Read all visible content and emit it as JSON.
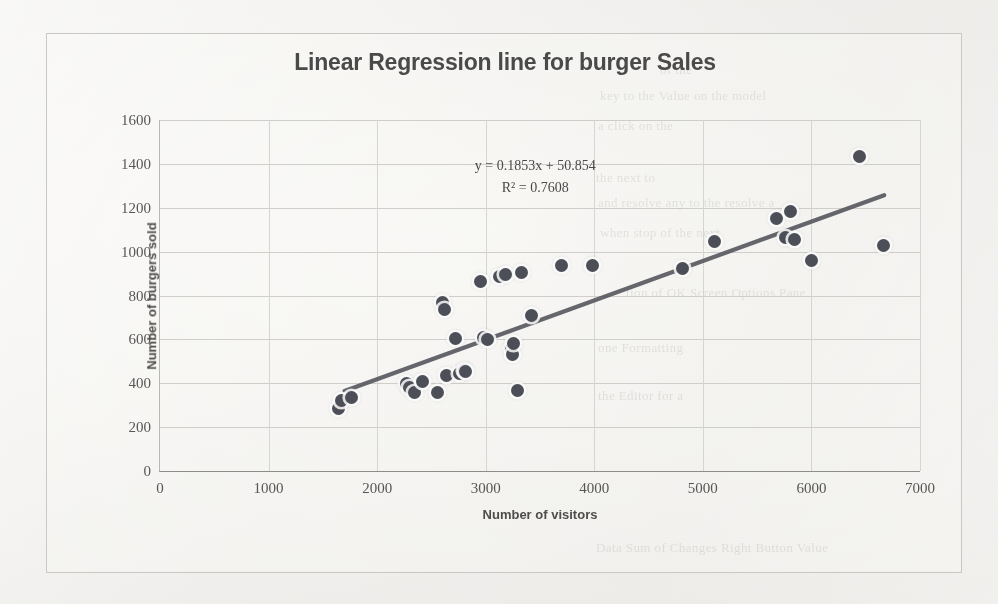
{
  "chart_data": {
    "type": "scatter",
    "title": "Linear Regression line for burger Sales",
    "xlabel": "Number of visitors",
    "ylabel": "Number of burgers sold",
    "xlim": [
      0,
      7000
    ],
    "ylim": [
      0,
      1600
    ],
    "xticks": [
      "0",
      "1000",
      "2000",
      "3000",
      "4000",
      "5000",
      "6000",
      "7000"
    ],
    "xtick_values": [
      0,
      1000,
      2000,
      3000,
      4000,
      5000,
      6000,
      7000
    ],
    "yticks": [
      "0",
      "200",
      "400",
      "600",
      "800",
      "1000",
      "1200",
      "1400",
      "1600"
    ],
    "ytick_values": [
      0,
      200,
      400,
      600,
      800,
      1000,
      1200,
      1400,
      1600
    ],
    "grid": true,
    "legend": false,
    "marker_color": "#4d4f58",
    "trendline_color": "#595b61",
    "annotations": {
      "equation": "y = 0.1853x + 50.854",
      "r_squared": "R² = 0.7608",
      "slope": 0.1853,
      "intercept": 50.854,
      "r2": 0.7608
    },
    "trendline": {
      "x_start": 1700,
      "y_start": 365,
      "x_end": 6670,
      "y_end": 1257
    },
    "series": [
      {
        "name": "Burger sales vs visitors",
        "points": [
          [
            1640,
            285
          ],
          [
            1670,
            320
          ],
          [
            1760,
            335
          ],
          [
            2270,
            400
          ],
          [
            2300,
            380
          ],
          [
            2340,
            360
          ],
          [
            2420,
            410
          ],
          [
            2560,
            360
          ],
          [
            2600,
            770
          ],
          [
            2620,
            735
          ],
          [
            2640,
            435
          ],
          [
            2720,
            605
          ],
          [
            2760,
            445
          ],
          [
            2800,
            460
          ],
          [
            2810,
            455
          ],
          [
            2950,
            865
          ],
          [
            2980,
            610
          ],
          [
            3020,
            600
          ],
          [
            3130,
            885
          ],
          [
            3180,
            895
          ],
          [
            3240,
            560
          ],
          [
            3250,
            530
          ],
          [
            3260,
            580
          ],
          [
            3290,
            365
          ],
          [
            3330,
            905
          ],
          [
            3420,
            710
          ],
          [
            3700,
            935
          ],
          [
            3980,
            935
          ],
          [
            4810,
            925
          ],
          [
            5110,
            1045
          ],
          [
            5680,
            1150
          ],
          [
            5760,
            1065
          ],
          [
            5810,
            1185
          ],
          [
            5840,
            1055
          ],
          [
            6000,
            960
          ],
          [
            6440,
            1435
          ],
          [
            6660,
            1030
          ]
        ]
      }
    ]
  },
  "background_bleed": [
    {
      "text": "of the",
      "x": 660,
      "y": 62
    },
    {
      "text": "key to the Value on the model",
      "x": 600,
      "y": 88
    },
    {
      "text": "a click on the",
      "x": 598,
      "y": 118
    },
    {
      "text": "the next to",
      "x": 596,
      "y": 170
    },
    {
      "text": "and resolve any to the resolve a",
      "x": 598,
      "y": 195
    },
    {
      "text": "when stop of the next",
      "x": 600,
      "y": 225
    },
    {
      "text": "tion of OK Screen Options Pane",
      "x": 626,
      "y": 285
    },
    {
      "text": "one Formatting",
      "x": 598,
      "y": 340
    },
    {
      "text": "the Editor for a",
      "x": 598,
      "y": 388
    },
    {
      "text": "Data   Sum of Changes   Right Button Value",
      "x": 596,
      "y": 540
    }
  ]
}
